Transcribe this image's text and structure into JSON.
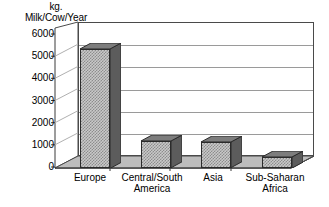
{
  "chart_data": {
    "type": "bar",
    "title": "",
    "ylabel": "kg. Milk/Cow/Year",
    "ylabel_lines": [
      "kg.",
      "Milk/Cow/Year"
    ],
    "xlabel": "",
    "categories": [
      "Europe",
      "Central/South America",
      "Asia",
      "Sub-Saharan Africa"
    ],
    "category_lines": [
      [
        "Europe"
      ],
      [
        "Central/South",
        "America"
      ],
      [
        "Asia"
      ],
      [
        "Sub-Saharan",
        "Africa"
      ]
    ],
    "values": [
      5350,
      1200,
      1150,
      500
    ],
    "ylim": [
      0,
      6000
    ],
    "yticks": [
      6000,
      5000,
      4000,
      3000,
      2000,
      1000,
      0
    ],
    "ytick_labels": [
      "6000",
      "5000",
      "4000",
      "3000",
      "2000",
      "1000",
      "0"
    ],
    "grid": true,
    "legend": "none",
    "style": "3d-column",
    "series": [
      {
        "name": "Milk yield",
        "values": [
          5350,
          1200,
          1150,
          500
        ]
      }
    ]
  },
  "colors": {
    "bar_front": "#c9c9c9",
    "bar_pattern": "#8d8d8d",
    "bar_side": "#5c5c5c",
    "bar_top": "#7d7d7d",
    "frame": "#4a4a4a",
    "gridline": "#9a9a9a",
    "floor": "#b8b8b8",
    "background": "#ffffff",
    "text": "#000000"
  }
}
